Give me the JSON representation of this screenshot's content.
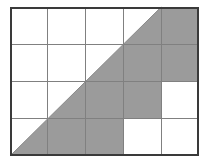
{
  "figure": {
    "grid": {
      "columns": 5,
      "rows": 4,
      "left": 10,
      "top": 7,
      "right": 199,
      "bottom": 156,
      "cell_width": 37.8,
      "cell_height": 37.25,
      "column_edges": [
        10,
        47.8,
        85.6,
        123.4,
        161.2,
        199
      ],
      "row_edges": [
        7,
        44.25,
        81.5,
        118.75,
        156
      ]
    },
    "colors": {
      "shaded": "#9b9b9b",
      "unshaded": "#ffffff",
      "outer_border": "#3a3a3a",
      "inner_grid_line": "#808080",
      "diagonal_line": "#8a8a8a",
      "background": "#ffffff"
    },
    "diagonal": {
      "description": "straight line from bottom-left corner of grid to top edge at column 4/5 boundary",
      "start_point": [
        10,
        156
      ],
      "end_point": [
        161.2,
        7
      ]
    },
    "cells": [
      {
        "row": 1,
        "col": 1,
        "state": "unshaded"
      },
      {
        "row": 1,
        "col": 2,
        "state": "unshaded"
      },
      {
        "row": 1,
        "col": 3,
        "state": "unshaded"
      },
      {
        "row": 1,
        "col": 4,
        "state": "half-shaded-lower-right"
      },
      {
        "row": 1,
        "col": 5,
        "state": "shaded"
      },
      {
        "row": 2,
        "col": 1,
        "state": "unshaded"
      },
      {
        "row": 2,
        "col": 2,
        "state": "unshaded"
      },
      {
        "row": 2,
        "col": 3,
        "state": "half-shaded-lower-right"
      },
      {
        "row": 2,
        "col": 4,
        "state": "shaded"
      },
      {
        "row": 2,
        "col": 5,
        "state": "shaded"
      },
      {
        "row": 3,
        "col": 1,
        "state": "unshaded"
      },
      {
        "row": 3,
        "col": 2,
        "state": "half-shaded-lower-right"
      },
      {
        "row": 3,
        "col": 3,
        "state": "shaded"
      },
      {
        "row": 3,
        "col": 4,
        "state": "shaded"
      },
      {
        "row": 3,
        "col": 5,
        "state": "unshaded"
      },
      {
        "row": 4,
        "col": 1,
        "state": "half-shaded-lower-right"
      },
      {
        "row": 4,
        "col": 2,
        "state": "shaded"
      },
      {
        "row": 4,
        "col": 3,
        "state": "shaded"
      },
      {
        "row": 4,
        "col": 4,
        "state": "unshaded"
      },
      {
        "row": 4,
        "col": 5,
        "state": "unshaded"
      }
    ],
    "counts": {
      "full_shaded_cells": 8,
      "half_shaded_cells": 4,
      "unshaded_cells": 8
    }
  }
}
